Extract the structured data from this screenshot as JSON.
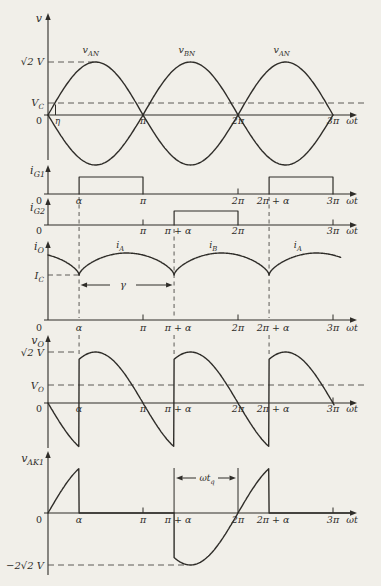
{
  "figure": {
    "background": "#f1efe9",
    "ink": "#2f2d29",
    "dash_color": "#4c4a45",
    "alpha_pi": 0.327,
    "eta_pi": 0.079
  },
  "chart_data": [
    {
      "id": "v",
      "type": "line",
      "ylabel": {
        "m": "v"
      },
      "xlabel": {
        "m": "ωt"
      },
      "series": [
        {
          "name": {
            "m": "v",
            "s": "AN"
          },
          "expr": "√2 V sin(ωt)"
        },
        {
          "name": {
            "m": "v",
            "s": "BN"
          },
          "expr": "−√2 V sin(ωt)"
        }
      ],
      "curve_labels": [
        {
          "t_pi": 0.45,
          "label": {
            "m": "v",
            "s": "AN"
          }
        },
        {
          "t_pi": 1.46,
          "label": {
            "m": "v",
            "s": "BN"
          }
        },
        {
          "t_pi": 2.46,
          "label": {
            "m": "v",
            "s": "AN"
          }
        }
      ],
      "levels": [
        {
          "label": {
            "m": "√2 V"
          },
          "value_frac": 1
        },
        {
          "label": {
            "m": "V",
            "s": "C"
          },
          "value_frac": 0.245
        }
      ],
      "ticks": [
        {
          "l": "0",
          "t": 0
        },
        {
          "l": "η",
          "t": 0.079
        },
        {
          "l": "π",
          "t": 1
        },
        {
          "l": "2π",
          "t": 2
        },
        {
          "l": "3π",
          "t": 3
        }
      ],
      "x_range_pi": [
        0,
        3
      ]
    },
    {
      "id": "iG1",
      "type": "pulse",
      "ylabel": {
        "m": "i",
        "s": "G1"
      },
      "xlabel": {
        "m": "ωt"
      },
      "pulses_pi": [
        [
          0.327,
          1
        ],
        [
          2.327,
          3
        ]
      ],
      "ticks": [
        {
          "l": "0",
          "t": 0
        },
        {
          "l": "α",
          "t": 0.327
        },
        {
          "l": "π",
          "t": 1
        },
        {
          "l": "2π",
          "t": 2
        },
        {
          "l": "2π + α",
          "t": 2.327
        },
        {
          "l": "3π",
          "t": 3
        }
      ]
    },
    {
      "id": "iG2",
      "type": "pulse",
      "ylabel": {
        "m": "i",
        "s": "G2"
      },
      "xlabel": {
        "m": "ωt"
      },
      "pulses_pi": [
        [
          1.327,
          2
        ]
      ],
      "ticks": [
        {
          "l": "0",
          "t": 0
        },
        {
          "l": "π",
          "t": 1
        },
        {
          "l": "π + α",
          "t": 1.327
        },
        {
          "l": "2π",
          "t": 2
        },
        {
          "l": "3π",
          "t": 3
        }
      ]
    },
    {
      "id": "iO",
      "type": "line",
      "ylabel": {
        "m": "i",
        "s": "O"
      },
      "xlabel": {
        "m": "ωt"
      },
      "levels": [
        {
          "label": {
            "m": "I",
            "s": "C"
          },
          "value_frac": 0.68
        }
      ],
      "curve_labels": [
        {
          "t_pi": 0.76,
          "label": {
            "m": "i",
            "s": "A"
          }
        },
        {
          "t_pi": 1.74,
          "label": {
            "m": "i",
            "s": "B"
          }
        },
        {
          "t_pi": 2.63,
          "label": {
            "m": "i",
            "s": "A"
          }
        }
      ],
      "annotations": [
        {
          "label": {
            "m": "γ"
          },
          "from_pi": 0.327,
          "to_pi": 1.327
        }
      ],
      "ticks": [
        {
          "l": "0",
          "t": 0
        },
        {
          "l": "α",
          "t": 0.327
        },
        {
          "l": "π",
          "t": 1
        },
        {
          "l": "π + α",
          "t": 1.327
        },
        {
          "l": "2π",
          "t": 2
        },
        {
          "l": "2π + α",
          "t": 2.327
        },
        {
          "l": "3π",
          "t": 3
        }
      ]
    },
    {
      "id": "vO",
      "type": "line",
      "ylabel": {
        "m": "v",
        "s": "O"
      },
      "xlabel": {
        "m": "ωt"
      },
      "levels": [
        {
          "label": {
            "m": "√2 V"
          },
          "value_frac": 1
        },
        {
          "label": {
            "m": "V",
            "s": "O"
          },
          "value_frac": 0.36
        }
      ],
      "ticks": [
        {
          "l": "0",
          "t": 0
        },
        {
          "l": "α",
          "t": 0.327
        },
        {
          "l": "π",
          "t": 1
        },
        {
          "l": "π + α",
          "t": 1.327
        },
        {
          "l": "2π",
          "t": 2
        },
        {
          "l": "2π + α",
          "t": 2.327
        },
        {
          "l": "3π",
          "t": 3
        }
      ]
    },
    {
      "id": "vAK1",
      "type": "line",
      "ylabel": {
        "m": "v",
        "s": "AK1"
      },
      "xlabel": {
        "m": "ωt"
      },
      "levels": [
        {
          "label": {
            "m": "−2√2 V"
          },
          "value_frac": -2
        }
      ],
      "annotations": [
        {
          "label": {
            "m": "ωt",
            "s": "q"
          },
          "from_pi": 1.327,
          "to_pi": 2
        }
      ],
      "ticks": [
        {
          "l": "0",
          "t": 0
        },
        {
          "l": "α",
          "t": 0.327
        },
        {
          "l": "π",
          "t": 1
        },
        {
          "l": "π + α",
          "t": 1.327
        },
        {
          "l": "2π",
          "t": 2
        },
        {
          "l": "2π + α",
          "t": 2.327
        },
        {
          "l": "3π",
          "t": 3
        }
      ]
    }
  ]
}
